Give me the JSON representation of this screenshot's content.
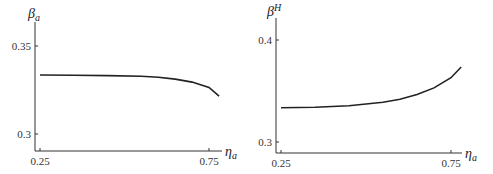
{
  "chart_data": [
    {
      "type": "line",
      "title": "",
      "ylabel": "β_a",
      "xlabel": "η_a",
      "xlim": [
        0.24,
        0.8
      ],
      "ylim": [
        0.29,
        0.36
      ],
      "xticks": [
        0.25,
        0.75
      ],
      "xtick_labels": [
        "0.25",
        "0.75"
      ],
      "yticks": [
        0.3,
        0.35
      ],
      "ytick_labels": [
        "0.3",
        "0.35"
      ],
      "grid": false,
      "series": [
        {
          "name": "β_a",
          "x": [
            0.25,
            0.35,
            0.45,
            0.55,
            0.6,
            0.65,
            0.7,
            0.75,
            0.78
          ],
          "y": [
            0.3335,
            0.3334,
            0.3332,
            0.3328,
            0.3322,
            0.3312,
            0.3295,
            0.3265,
            0.3215
          ]
        }
      ]
    },
    {
      "type": "line",
      "title": "",
      "ylabel": "β^H",
      "xlabel": "η_a",
      "xlim": [
        0.23,
        0.8
      ],
      "ylim": [
        0.29,
        0.41
      ],
      "xticks": [
        0.25,
        0.75
      ],
      "xtick_labels": [
        "0.25",
        "0.75"
      ],
      "yticks": [
        0.3,
        0.4
      ],
      "ytick_labels": [
        "0.3",
        "0.4"
      ],
      "grid": false,
      "series": [
        {
          "name": "β^H",
          "x": [
            0.25,
            0.35,
            0.45,
            0.55,
            0.6,
            0.65,
            0.7,
            0.75,
            0.78
          ],
          "y": [
            0.3335,
            0.334,
            0.3355,
            0.339,
            0.342,
            0.3465,
            0.353,
            0.363,
            0.3735
          ]
        }
      ]
    }
  ],
  "labels": {
    "left": {
      "y_main": "β",
      "y_sub": "a",
      "x_main": "η",
      "x_sub": "a",
      "yt_top": "0.35",
      "yt_bot": "0.3",
      "xt_left": "0.25",
      "xt_right": "0.75"
    },
    "right": {
      "y_main": "β",
      "y_sup": "H",
      "x_main": "η",
      "x_sub": "a",
      "yt_top": "0.4",
      "yt_bot": "0.3",
      "xt_left": "0.25",
      "xt_right": "0.75"
    }
  }
}
